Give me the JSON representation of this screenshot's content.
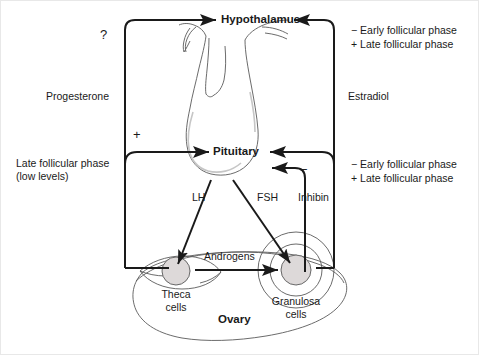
{
  "diagram": {
    "nodes": {
      "hypothalamus": "Hypothalamus",
      "pituitary": "Pituitary",
      "ovary": "Ovary",
      "theca_cells_line1": "Theca",
      "theca_cells_line2": "cells",
      "granulosa_cells_line1": "Granulosa",
      "granulosa_cells_line2": "cells"
    },
    "hormones": {
      "progesterone": "Progesterone",
      "estradiol": "Estradiol",
      "lh": "LH",
      "fsh": "FSH",
      "inhibin": "Inhibin",
      "androgens": "Androgens"
    },
    "signs": {
      "question_mark": "?",
      "plus_pituitary": "+",
      "minus_inhibin": "−"
    },
    "annotations": {
      "left_lower_line1": "Late follicular phase",
      "left_lower_line2": "(low levels)",
      "right_upper_neg": "− Early follicular phase",
      "right_upper_pos": "+ Late follicular phase",
      "right_lower_neg": "− Early follicular phase",
      "right_lower_pos": "+ Late follicular phase"
    },
    "colors": {
      "stroke": "#1a1a1a",
      "anatomy_stroke": "#5a5a5a",
      "cell_fill": "#d9d9d9",
      "background": "#ffffff"
    }
  }
}
